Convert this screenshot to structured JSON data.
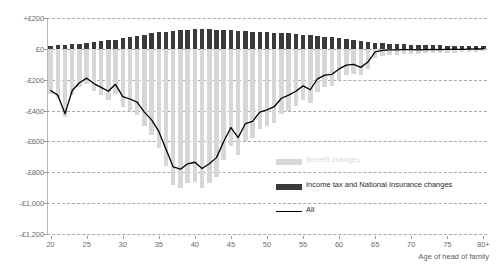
{
  "chart_data": {
    "type": "bar",
    "title": "",
    "subtitle": "",
    "xlabel": "Age of head of family",
    "ylabel": "",
    "ylim": [
      -1200,
      200
    ],
    "grid": true,
    "legend_position": "right-inside",
    "y_ticks": [
      200,
      0,
      -200,
      -400,
      -600,
      -800,
      -1000,
      -1200
    ],
    "y_tick_labels": [
      "+£200",
      "£0",
      "-£200",
      "-£400",
      "-£600",
      "-£800",
      "-£1,000",
      "-£1,200"
    ],
    "x_ticks": [
      20,
      25,
      30,
      35,
      40,
      45,
      50,
      55,
      60,
      65,
      70,
      75,
      80
    ],
    "x_tick_labels": [
      "20",
      "25",
      "30",
      "35",
      "40",
      "45",
      "50",
      "55",
      "60",
      "65",
      "70",
      "75",
      "80+"
    ],
    "categories": [
      20,
      21,
      22,
      23,
      24,
      25,
      26,
      27,
      28,
      29,
      30,
      31,
      32,
      33,
      34,
      35,
      36,
      37,
      38,
      39,
      40,
      41,
      42,
      43,
      44,
      45,
      46,
      47,
      48,
      49,
      50,
      51,
      52,
      53,
      54,
      55,
      56,
      57,
      58,
      59,
      60,
      61,
      62,
      63,
      64,
      65,
      66,
      67,
      68,
      69,
      70,
      71,
      72,
      73,
      74,
      75,
      76,
      77,
      78,
      79,
      80
    ],
    "series": [
      {
        "name": "Benefit changes",
        "kind": "bar",
        "color": "#d7d7d7",
        "values": [
          -290,
          -320,
          -440,
          -300,
          -250,
          -230,
          -270,
          -300,
          -330,
          -290,
          -380,
          -400,
          -430,
          -500,
          -560,
          -640,
          -760,
          -880,
          -900,
          -870,
          -860,
          -900,
          -870,
          -830,
          -720,
          -630,
          -690,
          -600,
          -580,
          -520,
          -500,
          -480,
          -420,
          -400,
          -370,
          -330,
          -350,
          -280,
          -250,
          -240,
          -200,
          -170,
          -160,
          -170,
          -130,
          -60,
          -45,
          -40,
          -38,
          -35,
          -33,
          -32,
          -30,
          -28,
          -27,
          -25,
          -24,
          -22,
          -20,
          -18,
          -15
        ]
      },
      {
        "name": "Income tax and National Insurance changes",
        "kind": "bar",
        "color": "#3a3a3a",
        "values": [
          20,
          22,
          25,
          30,
          32,
          38,
          45,
          50,
          55,
          60,
          70,
          78,
          85,
          92,
          100,
          108,
          112,
          118,
          122,
          125,
          128,
          128,
          126,
          124,
          122,
          120,
          118,
          116,
          112,
          110,
          108,
          105,
          102,
          100,
          96,
          92,
          88,
          84,
          80,
          76,
          70,
          64,
          58,
          52,
          46,
          40,
          36,
          34,
          32,
          30,
          28,
          26,
          25,
          24,
          22,
          21,
          20,
          19,
          18,
          17,
          16
        ]
      },
      {
        "name": "All",
        "kind": "line",
        "color": "#000000",
        "values": [
          -270,
          -300,
          -420,
          -270,
          -220,
          -190,
          -225,
          -250,
          -275,
          -230,
          -310,
          -325,
          -345,
          -410,
          -460,
          -535,
          -650,
          -765,
          -780,
          -745,
          -735,
          -775,
          -745,
          -705,
          -600,
          -510,
          -575,
          -485,
          -470,
          -410,
          -395,
          -375,
          -320,
          -300,
          -275,
          -240,
          -265,
          -195,
          -170,
          -165,
          -130,
          -105,
          -100,
          -120,
          -85,
          -20,
          -10,
          -6,
          -6,
          -5,
          -5,
          -6,
          -5,
          -4,
          -5,
          -4,
          -4,
          -3,
          -2,
          -1,
          0
        ]
      }
    ],
    "legend": [
      {
        "label": "Benefit changes",
        "color": "#d7d7d7",
        "style": "swatch"
      },
      {
        "label": "Income tax and National Insurance changes",
        "color": "#3a3a3a",
        "style": "swatch"
      },
      {
        "label": "All",
        "color": "#000000",
        "style": "line"
      }
    ]
  }
}
